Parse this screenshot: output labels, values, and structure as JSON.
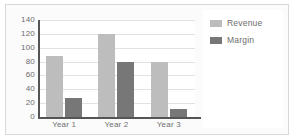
{
  "chart_data": {
    "type": "bar",
    "title": "",
    "xlabel": "",
    "ylabel": "",
    "categories": [
      "Year 1",
      "Year 2",
      "Year 3"
    ],
    "series": [
      {
        "name": "Revenue",
        "color": "#bdbdbd",
        "values": [
          88,
          120,
          80
        ]
      },
      {
        "name": "Margin",
        "color": "#777777",
        "values": [
          28,
          80,
          11
        ]
      }
    ],
    "ylim": [
      0,
      140
    ],
    "yticks": [
      0,
      20,
      40,
      60,
      80,
      100,
      120,
      140
    ],
    "grid": true,
    "legend_position": "right"
  },
  "legend": {
    "entries": [
      {
        "label": "Revenue",
        "swatch": "revenue-swatch"
      },
      {
        "label": "Margin",
        "swatch": "margin-swatch"
      }
    ]
  },
  "colors": {
    "revenue": "#bdbdbd",
    "margin": "#777777",
    "grid": "#e2e2e2",
    "axis": "#555555",
    "text": "#6d6d6d",
    "plot_background": "#ffffff",
    "figure_background": "#fbfbfb",
    "frame_border": "#d8d8d8"
  }
}
